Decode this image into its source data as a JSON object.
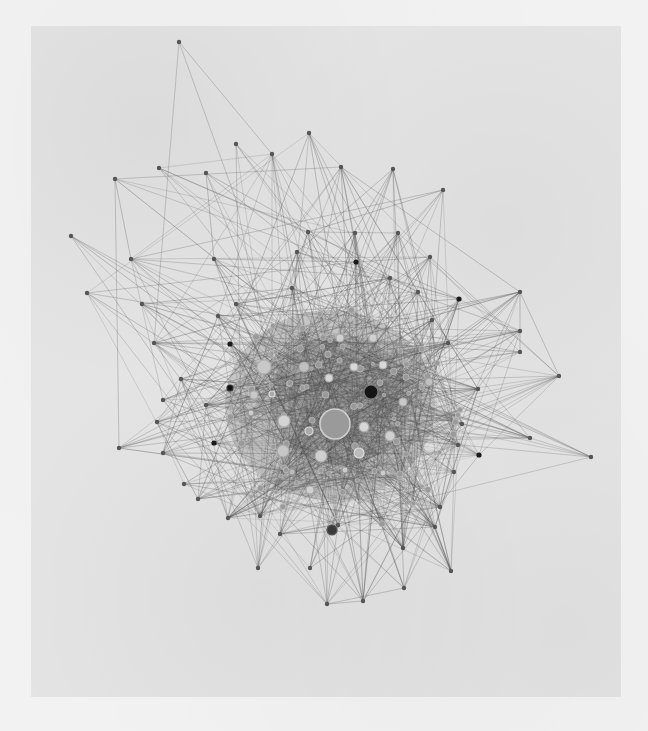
{
  "figure": {
    "type": "network-graph",
    "background_color": "#e4e4e4",
    "edge_color": "#555555",
    "node_colors": {
      "peripheral": "#555555",
      "dark": "#1a1a1a",
      "light": "#c9c9c9",
      "hub": "#9a9a9a",
      "ring": "#bdbdbd"
    },
    "hubs": [
      {
        "id": "hub-center",
        "x": 335,
        "y": 424,
        "r": 15,
        "fill": "#9a9a9a",
        "stroke": "#d0d0d0"
      },
      {
        "id": "hub-dark",
        "x": 371,
        "y": 392,
        "r": 7,
        "fill": "#151515",
        "stroke": "#777777"
      },
      {
        "id": "n-a",
        "x": 264,
        "y": 367,
        "r": 7,
        "fill": "#c8c8c8",
        "stroke": "#b0b0b0"
      },
      {
        "id": "n-b",
        "x": 284,
        "y": 421,
        "r": 6,
        "fill": "#d4d4d4",
        "stroke": "#b0b0b0"
      },
      {
        "id": "n-c",
        "x": 283,
        "y": 451,
        "r": 6,
        "fill": "#c6c6c6",
        "stroke": "#a8a8a8"
      },
      {
        "id": "n-d",
        "x": 321,
        "y": 456,
        "r": 6,
        "fill": "#cfcfcf",
        "stroke": "#aaaaaa"
      },
      {
        "id": "n-e",
        "x": 390,
        "y": 436,
        "r": 5,
        "fill": "#d0d0d0",
        "stroke": "#aaaaaa"
      },
      {
        "id": "n-f",
        "x": 364,
        "y": 427,
        "r": 5,
        "fill": "#d6d6d6",
        "stroke": "#aaaaaa"
      },
      {
        "id": "n-g",
        "x": 359,
        "y": 453,
        "r": 5,
        "fill": "#bbbbbb",
        "stroke": "#dddddd"
      },
      {
        "id": "n-h",
        "x": 309,
        "y": 431,
        "r": 4,
        "fill": "#aaaaaa",
        "stroke": "#dddddd"
      },
      {
        "id": "n-i",
        "x": 329,
        "y": 378,
        "r": 4,
        "fill": "#d6d6d6",
        "stroke": "#aaaaaa"
      },
      {
        "id": "n-j",
        "x": 304,
        "y": 367,
        "r": 5,
        "fill": "#c0c0c0",
        "stroke": "#aaaaaa"
      },
      {
        "id": "n-k",
        "x": 354,
        "y": 367,
        "r": 4,
        "fill": "#d8d8d8",
        "stroke": "#aaaaaa"
      },
      {
        "id": "n-l",
        "x": 383,
        "y": 365,
        "r": 4,
        "fill": "#d8d8d8",
        "stroke": "#aaaaaa"
      },
      {
        "id": "n-m",
        "x": 340,
        "y": 338,
        "r": 4,
        "fill": "#d0d0d0",
        "stroke": "#aaaaaa"
      },
      {
        "id": "n-n",
        "x": 373,
        "y": 338,
        "r": 4,
        "fill": "#d0d0d0",
        "stroke": "#aaaaaa"
      },
      {
        "id": "n-o",
        "x": 310,
        "y": 490,
        "r": 4,
        "fill": "#d0d0d0",
        "stroke": "#aaaaaa"
      },
      {
        "id": "n-p",
        "x": 403,
        "y": 402,
        "r": 4,
        "fill": "#c8c8c8",
        "stroke": "#aaaaaa"
      },
      {
        "id": "n-q",
        "x": 254,
        "y": 395,
        "r": 4,
        "fill": "#c8c8c8",
        "stroke": "#aaaaaa"
      },
      {
        "id": "n-r",
        "x": 332,
        "y": 530,
        "r": 5,
        "fill": "#3a3a3a",
        "stroke": "#555555"
      },
      {
        "id": "n-s",
        "x": 230,
        "y": 388,
        "r": 3,
        "fill": "#111111",
        "stroke": "#333333"
      },
      {
        "id": "n-t",
        "x": 429,
        "y": 382,
        "r": 4,
        "fill": "#c0c0c0",
        "stroke": "#999999"
      },
      {
        "id": "n-u",
        "x": 383,
        "y": 473,
        "r": 3,
        "fill": "#cccccc",
        "stroke": "#999999"
      },
      {
        "id": "n-v",
        "x": 251,
        "y": 413,
        "r": 3,
        "fill": "#cccccc",
        "stroke": "#999999"
      },
      {
        "id": "n-w",
        "x": 272,
        "y": 394,
        "r": 3,
        "fill": "#aaaaaa",
        "stroke": "#dddddd"
      },
      {
        "id": "n-x",
        "x": 345,
        "y": 470,
        "r": 3,
        "fill": "#cccccc",
        "stroke": "#999999"
      },
      {
        "id": "n-y",
        "x": 292,
        "y": 472,
        "r": 3,
        "fill": "#bbbbbb",
        "stroke": "#999999"
      }
    ],
    "peripheral_nodes": [
      [
        179,
        42
      ],
      [
        309,
        133
      ],
      [
        236,
        144
      ],
      [
        272,
        154
      ],
      [
        159,
        168
      ],
      [
        206,
        173
      ],
      [
        341,
        167
      ],
      [
        393,
        169
      ],
      [
        115,
        179
      ],
      [
        443,
        190
      ],
      [
        71,
        236
      ],
      [
        308,
        232
      ],
      [
        355,
        233
      ],
      [
        398,
        233
      ],
      [
        131,
        259
      ],
      [
        214,
        259
      ],
      [
        297,
        252
      ],
      [
        430,
        257
      ],
      [
        356,
        262
      ],
      [
        87,
        293
      ],
      [
        142,
        304
      ],
      [
        520,
        292
      ],
      [
        459,
        299
      ],
      [
        236,
        304
      ],
      [
        520,
        331
      ],
      [
        520,
        352
      ],
      [
        230,
        344
      ],
      [
        154,
        343
      ],
      [
        559,
        376
      ],
      [
        478,
        389
      ],
      [
        530,
        438
      ],
      [
        591,
        457
      ],
      [
        479,
        455
      ],
      [
        454,
        472
      ],
      [
        119,
        448
      ],
      [
        163,
        453
      ],
      [
        157,
        422
      ],
      [
        163,
        400
      ],
      [
        181,
        379
      ],
      [
        214,
        443
      ],
      [
        184,
        484
      ],
      [
        198,
        499
      ],
      [
        228,
        518
      ],
      [
        260,
        516
      ],
      [
        280,
        534
      ],
      [
        338,
        525
      ],
      [
        435,
        527
      ],
      [
        451,
        571
      ],
      [
        404,
        588
      ],
      [
        363,
        601
      ],
      [
        327,
        604
      ],
      [
        390,
        278
      ],
      [
        418,
        292
      ],
      [
        432,
        320
      ],
      [
        448,
        343
      ],
      [
        462,
        424
      ],
      [
        440,
        507
      ],
      [
        403,
        548
      ],
      [
        258,
        568
      ],
      [
        310,
        568
      ],
      [
        458,
        445
      ],
      [
        218,
        316
      ],
      [
        292,
        288
      ],
      [
        206,
        405
      ]
    ],
    "dark_peripheral_nodes": [
      [
        356,
        262
      ],
      [
        459,
        299
      ],
      [
        230,
        344
      ],
      [
        214,
        443
      ],
      [
        479,
        455
      ]
    ]
  }
}
